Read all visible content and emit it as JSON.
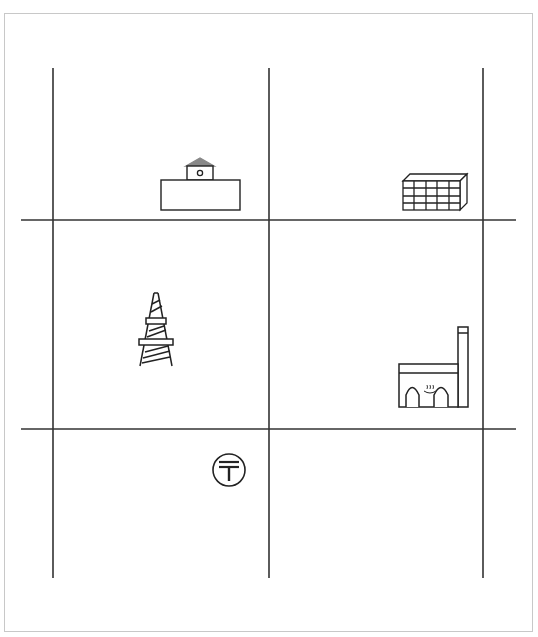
{
  "diagram": {
    "title": "",
    "grid": {
      "vertical_lines_x": [
        53,
        269,
        483
      ],
      "horizontal_lines_y": [
        220,
        429
      ],
      "line_color": "#333333"
    },
    "symbols": [
      {
        "id": "government-office",
        "label": "Government office / public building",
        "cell": "row1-col1"
      },
      {
        "id": "office-building",
        "label": "Multi-storey building",
        "cell": "row1-col2"
      },
      {
        "id": "transmission-tower",
        "label": "Radio / transmission tower",
        "cell": "row2-col1"
      },
      {
        "id": "hot-spring-factory",
        "label": "Hot spring bath house",
        "cell": "row2-col2"
      },
      {
        "id": "post-office",
        "label": "Post office",
        "cell": "row3-col1"
      }
    ]
  }
}
